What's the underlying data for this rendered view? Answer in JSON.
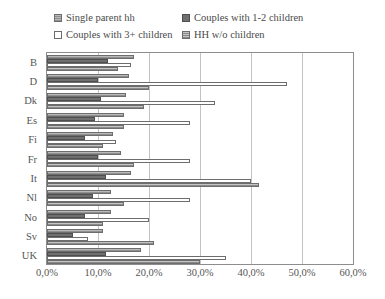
{
  "legend": {
    "items": [
      {
        "label": "Single parent hh",
        "swatch": "hatched-gray"
      },
      {
        "label": "Couples with 1-2 children",
        "swatch": "solid-dark-gray"
      },
      {
        "label": "Couples with 3+ children",
        "swatch": "white"
      },
      {
        "label": "HH w/o children",
        "swatch": "hatched-light-gray"
      }
    ]
  },
  "axis": {
    "x_ticks": [
      "0,0%",
      "10,0%",
      "20,0%",
      "30,0%",
      "40,0%",
      "50,0%",
      "60,0%"
    ],
    "y_ticks": [
      "B",
      "D",
      "Dk",
      "Es",
      "Fi",
      "Fr",
      "It",
      "Nl",
      "No",
      "Sv",
      "UK"
    ]
  },
  "chart_data": {
    "type": "bar",
    "orientation": "horizontal",
    "title": "",
    "xlabel": "",
    "ylabel": "",
    "xlim": [
      0,
      60
    ],
    "grid": true,
    "legend_position": "top",
    "categories": [
      "B",
      "D",
      "Dk",
      "Es",
      "Fi",
      "Fr",
      "It",
      "Nl",
      "No",
      "Sv",
      "UK"
    ],
    "series": [
      {
        "name": "Single parent hh",
        "values": [
          17.0,
          16.0,
          15.5,
          15.0,
          13.0,
          14.5,
          16.5,
          12.5,
          12.5,
          11.0,
          18.5
        ]
      },
      {
        "name": "Couples with 1-2 children",
        "values": [
          12.0,
          10.0,
          10.5,
          9.5,
          7.5,
          10.0,
          11.5,
          9.0,
          7.5,
          5.0,
          11.5
        ]
      },
      {
        "name": "Couples with 3+ children",
        "values": [
          16.5,
          47.0,
          33.0,
          28.0,
          13.5,
          28.0,
          40.0,
          28.0,
          20.0,
          8.0,
          35.0
        ]
      },
      {
        "name": "HH w/o children",
        "values": [
          14.0,
          20.0,
          19.0,
          15.0,
          11.0,
          17.0,
          41.5,
          15.0,
          11.0,
          21.0,
          30.0
        ]
      }
    ]
  }
}
